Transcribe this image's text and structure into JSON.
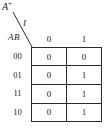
{
  "diagram": {
    "type": "karnaugh-map",
    "corner_header": {
      "top_label_base": "A",
      "top_label_superscript": "+",
      "top_label_full": "A+",
      "input_label": "I",
      "row_vars_label": "AB"
    },
    "column_headers": [
      "0",
      "1"
    ],
    "row_headers": [
      "00",
      "01",
      "11",
      "10"
    ],
    "cells": [
      [
        "0",
        "0"
      ],
      [
        "0",
        "1"
      ],
      [
        "0",
        "1"
      ],
      [
        "0",
        "1"
      ]
    ],
    "colors": {
      "ink": "#1a1a1a",
      "rule": "#2b2b2b",
      "background": "#ffffff"
    }
  }
}
